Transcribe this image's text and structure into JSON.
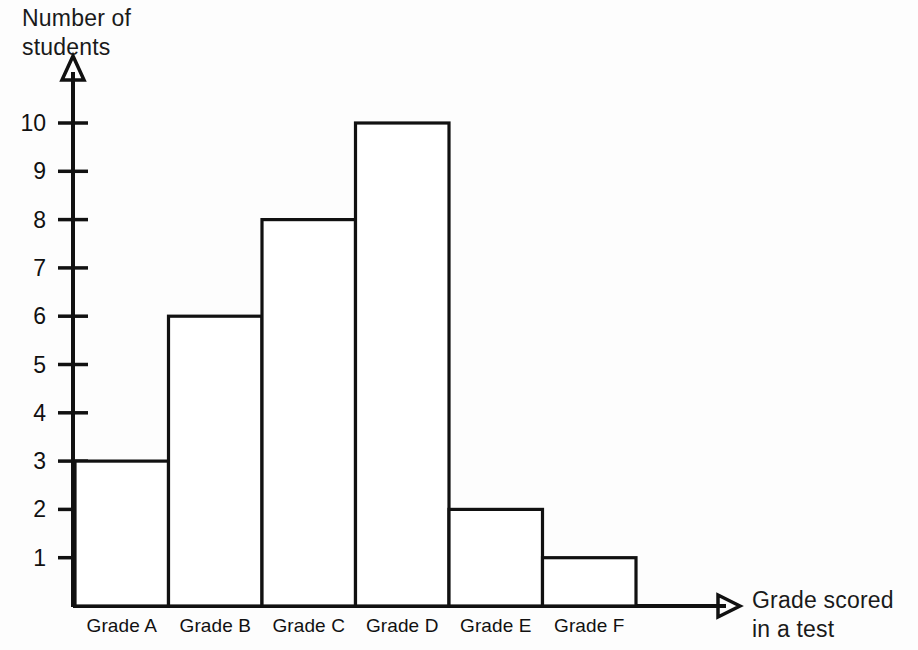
{
  "chart_data": {
    "type": "bar",
    "title": "",
    "subtitle": "",
    "xlabel": "Grade scored\nin a test",
    "ylabel": "Number of\nstudents",
    "categories": [
      "Grade A",
      "Grade B",
      "Grade C",
      "Grade D",
      "Grade E",
      "Grade F"
    ],
    "values": [
      3,
      6,
      8,
      10,
      2,
      1
    ],
    "series": [
      {
        "name": "Number of students",
        "values": [
          3,
          6,
          8,
          10,
          2,
          1
        ]
      }
    ],
    "ylim": [
      0,
      11
    ],
    "ytick_labels": [
      "1",
      "2",
      "3",
      "4",
      "5",
      "6",
      "7",
      "8",
      "9",
      "10"
    ],
    "ytick_values": [
      1,
      2,
      3,
      4,
      5,
      6,
      7,
      8,
      9,
      10
    ],
    "grid": false,
    "legend": false,
    "legend_position": "none",
    "bar_style": "adjacent-outline",
    "axis_arrows": true,
    "colors": {
      "bar_fill": "#ffffff",
      "bar_stroke": "#111111",
      "axis": "#111111",
      "text": "#111111",
      "background": "#fdfdfd"
    }
  },
  "axis_titles": {
    "y": "Number of\nstudents",
    "x": "Grade scored\nin a test"
  }
}
